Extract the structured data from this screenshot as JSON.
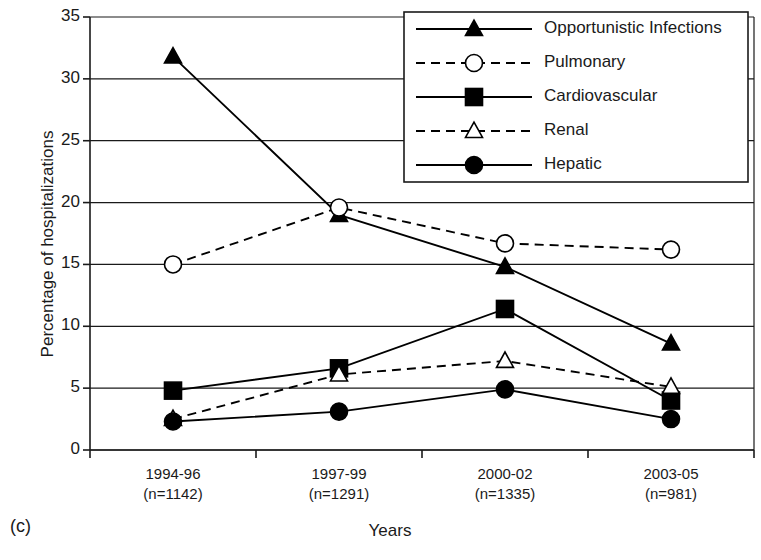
{
  "panel": {
    "letter": "(c)"
  },
  "chart_data": {
    "type": "line",
    "title": "",
    "xlabel": "Years",
    "ylabel": "Percentage of hospitalizations",
    "categories": [
      "1994-96",
      "1997-99",
      "2000-02",
      "2003-05"
    ],
    "category_sublabels": [
      "(n=1142)",
      "(n=1291)",
      "(n=1335)",
      "(n=981)"
    ],
    "ylim": [
      0,
      35
    ],
    "ytick_values": [
      0,
      5,
      10,
      15,
      20,
      25,
      30,
      35
    ],
    "ytick_labels": [
      "0",
      "5",
      "10",
      "15",
      "20",
      "25",
      "30",
      "35"
    ],
    "grid": true,
    "legend_position": "top-right",
    "series": [
      {
        "name": "Opportunistic Infections",
        "values": [
          31.8,
          19.0,
          14.8,
          8.6
        ],
        "marker": "filled-triangle",
        "line_style": "solid",
        "color": "#000000"
      },
      {
        "name": "Pulmonary",
        "values": [
          15.0,
          19.6,
          16.7,
          16.2
        ],
        "marker": "open-circle",
        "line_style": "dashed",
        "color": "#000000"
      },
      {
        "name": "Cardiovascular",
        "values": [
          4.8,
          6.6,
          11.4,
          4.0
        ],
        "marker": "filled-square",
        "line_style": "solid",
        "color": "#000000"
      },
      {
        "name": "Renal",
        "values": [
          2.5,
          6.1,
          7.2,
          5.1
        ],
        "marker": "open-triangle",
        "line_style": "dashed",
        "color": "#000000"
      },
      {
        "name": "Hepatic",
        "values": [
          2.3,
          3.1,
          4.9,
          2.5
        ],
        "marker": "filled-circle",
        "line_style": "solid",
        "color": "#000000"
      }
    ]
  }
}
